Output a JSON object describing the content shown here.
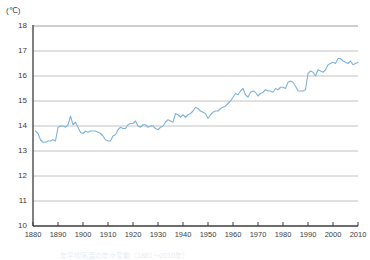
{
  "chart_data": {
    "type": "line",
    "title": "",
    "subtitle": "",
    "xlabel": "",
    "ylabel": "",
    "unit_label": "(℃)",
    "xlim": [
      1880,
      2010
    ],
    "ylim": [
      10,
      18
    ],
    "yticks": [
      18,
      17,
      16,
      15,
      14,
      13,
      12,
      11,
      10
    ],
    "xticks": [
      1880,
      1890,
      1900,
      1910,
      1920,
      1930,
      1940,
      1950,
      1960,
      1970,
      1980,
      1990,
      2000,
      2010
    ],
    "grid": true,
    "legend": "none",
    "line_color": "#7fb3db",
    "axis_color": "#3c3c3c",
    "grid_color": "#b3b3b3",
    "series": [
      {
        "name": "Annual mean temperature",
        "x": [
          1881,
          1882,
          1883,
          1884,
          1885,
          1886,
          1887,
          1888,
          1889,
          1890,
          1891,
          1892,
          1893,
          1894,
          1895,
          1896,
          1897,
          1898,
          1899,
          1900,
          1901,
          1902,
          1903,
          1904,
          1905,
          1906,
          1907,
          1908,
          1909,
          1910,
          1911,
          1912,
          1913,
          1914,
          1915,
          1916,
          1917,
          1918,
          1919,
          1920,
          1921,
          1922,
          1923,
          1924,
          1925,
          1926,
          1927,
          1928,
          1929,
          1930,
          1931,
          1932,
          1933,
          1934,
          1935,
          1936,
          1937,
          1938,
          1939,
          1940,
          1941,
          1942,
          1943,
          1944,
          1945,
          1946,
          1947,
          1948,
          1949,
          1950,
          1951,
          1952,
          1953,
          1954,
          1955,
          1956,
          1957,
          1958,
          1959,
          1960,
          1961,
          1962,
          1963,
          1964,
          1965,
          1966,
          1967,
          1968,
          1969,
          1970,
          1971,
          1972,
          1973,
          1974,
          1975,
          1976,
          1977,
          1978,
          1979,
          1980,
          1981,
          1982,
          1983,
          1984,
          1985,
          1986,
          1987,
          1988,
          1989,
          1990,
          1991,
          1992,
          1993,
          1994,
          1995,
          1996,
          1997,
          1998,
          1999,
          2000,
          2001,
          2002,
          2003,
          2004,
          2005,
          2006,
          2007,
          2008,
          2009,
          2010
        ],
        "values": [
          13.8,
          13.7,
          13.45,
          13.35,
          13.35,
          13.4,
          13.4,
          13.45,
          13.4,
          13.95,
          14.0,
          14.0,
          13.95,
          14.05,
          14.4,
          14.05,
          14.15,
          13.95,
          13.75,
          13.7,
          13.8,
          13.75,
          13.8,
          13.8,
          13.8,
          13.75,
          13.7,
          13.6,
          13.45,
          13.4,
          13.4,
          13.6,
          13.65,
          13.85,
          13.95,
          13.9,
          13.9,
          14.05,
          14.1,
          14.1,
          14.2,
          14.0,
          13.95,
          14.05,
          14.05,
          13.95,
          14.0,
          14.0,
          13.9,
          13.85,
          13.95,
          14.0,
          14.15,
          14.25,
          14.2,
          14.15,
          14.5,
          14.45,
          14.35,
          14.45,
          14.35,
          14.45,
          14.5,
          14.6,
          14.75,
          14.7,
          14.6,
          14.55,
          14.5,
          14.3,
          14.45,
          14.55,
          14.6,
          14.6,
          14.7,
          14.75,
          14.8,
          14.9,
          15.0,
          15.15,
          15.3,
          15.25,
          15.4,
          15.5,
          15.25,
          15.15,
          15.35,
          15.4,
          15.35,
          15.2,
          15.3,
          15.35,
          15.45,
          15.4,
          15.4,
          15.35,
          15.5,
          15.45,
          15.55,
          15.55,
          15.5,
          15.75,
          15.8,
          15.75,
          15.6,
          15.4,
          15.4,
          15.4,
          15.45,
          16.1,
          16.2,
          16.15,
          16.0,
          16.25,
          16.2,
          16.15,
          16.25,
          16.45,
          16.5,
          16.55,
          16.5,
          16.7,
          16.7,
          16.6,
          16.55,
          16.5,
          16.6,
          16.45,
          16.5,
          16.55
        ]
      }
    ],
    "annotations": []
  },
  "caption": {
    "text": "年平均気温の年々変動（1881～2010年）"
  }
}
